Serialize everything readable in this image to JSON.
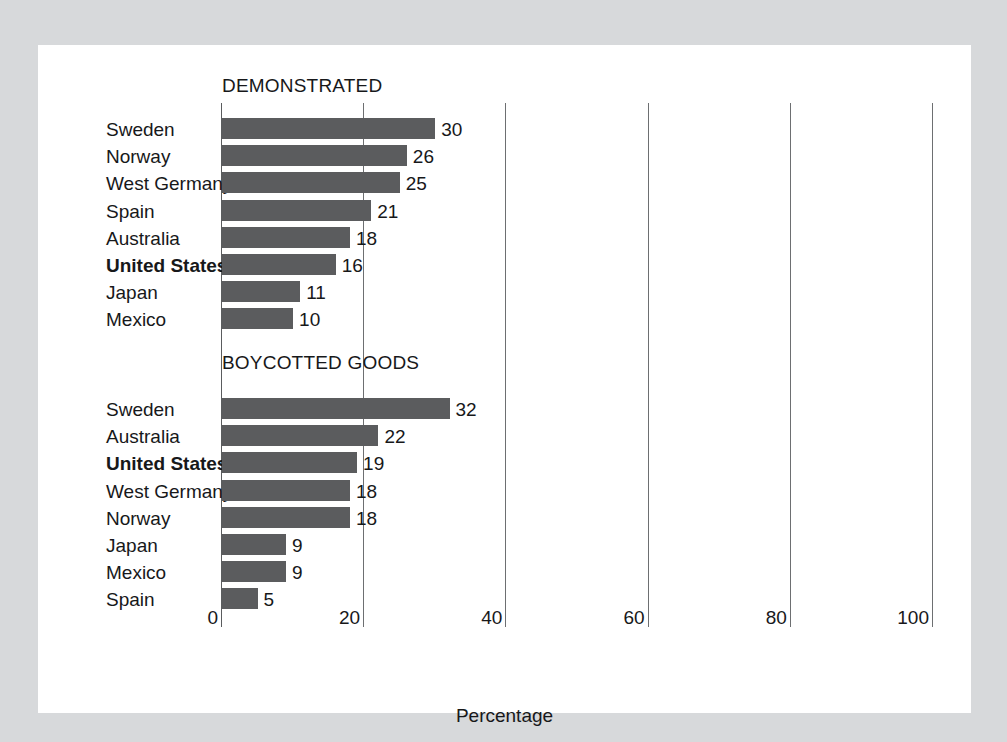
{
  "chart_data": {
    "type": "bar",
    "orientation": "horizontal",
    "title": "",
    "xlabel": "Percentage",
    "ylabel": "",
    "xlim": [
      0,
      100
    ],
    "xticks": [
      0,
      20,
      40,
      60,
      80,
      100
    ],
    "xtick_labels": [
      "0",
      "20",
      "40",
      "60",
      "80",
      "100"
    ],
    "grid": true,
    "legend": "none",
    "highlight_category": "United States",
    "panels": [
      {
        "title": "DEMONSTRATED",
        "categories": [
          "Sweden",
          "Norway",
          "West Germany",
          "Spain",
          "Australia",
          "United States",
          "Japan",
          "Mexico"
        ],
        "values": [
          30,
          26,
          25,
          21,
          18,
          16,
          11,
          10
        ],
        "value_labels": [
          "30",
          "26",
          "25",
          "21",
          "18",
          "16",
          "11",
          "10"
        ]
      },
      {
        "title": "BOYCOTTED GOODS",
        "categories": [
          "Sweden",
          "Australia",
          "United States",
          "West Germany",
          "Norway",
          "Japan",
          "Mexico",
          "Spain"
        ],
        "values": [
          32,
          22,
          19,
          18,
          18,
          9,
          9,
          5
        ],
        "value_labels": [
          "32",
          "22",
          "19",
          "18",
          "18",
          "9",
          "9",
          "5"
        ]
      }
    ]
  },
  "colors": {
    "bar": "#5b5c5e",
    "gridline": "#6d6f71",
    "panel_background": "#ffffff",
    "page_background": "#d7d9db",
    "text": "#17181a"
  }
}
